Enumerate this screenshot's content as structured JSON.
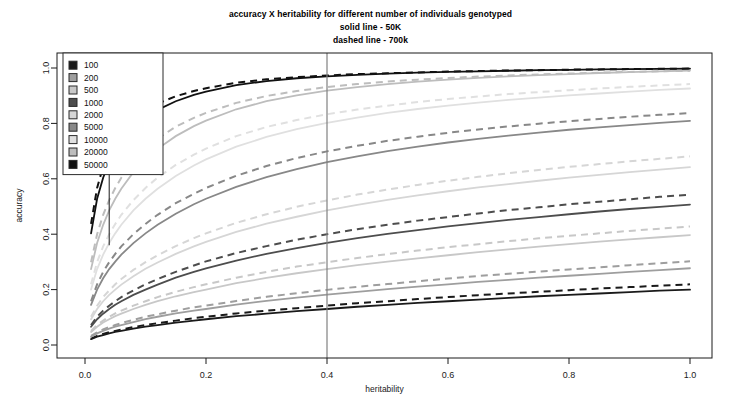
{
  "chart_data": {
    "type": "line",
    "title": "accuracy X heritability for different number of individuals genotyped",
    "subtitle_1": "solid line - 50K",
    "subtitle_2": "dashed line - 700k",
    "xlabel": "heritability",
    "ylabel": "accuracy",
    "xlim": [
      0.0,
      1.0
    ],
    "ylim": [
      0.0,
      1.0
    ],
    "xticks": [
      "0.0",
      "0.2",
      "0.4",
      "0.6",
      "0.8",
      "1.0"
    ],
    "xtick_values": [
      0.0,
      0.2,
      0.4,
      0.6,
      0.8,
      1.0
    ],
    "yticks": [
      "0.0",
      "0.2",
      "0.4",
      "0.6",
      "0.8",
      "1.0"
    ],
    "ytick_values": [
      0.0,
      0.2,
      0.4,
      0.6,
      0.8,
      1.0
    ],
    "grid": false,
    "legend_position": "top-left",
    "legend_title": "",
    "reference_lines": [
      {
        "name": "vertical-marker-0.4",
        "orientation": "vertical",
        "x": 0.4,
        "color": "#808080",
        "width": 1.2
      },
      {
        "name": "vertical-marker-0.04",
        "orientation": "vertical",
        "x": 0.04,
        "color": "#1a1a1a",
        "width": 1.0,
        "y_from": 0.36,
        "y_to": 1.05
      }
    ],
    "x": [
      0.01,
      0.02,
      0.03,
      0.04,
      0.05,
      0.06,
      0.08,
      0.1,
      0.12,
      0.15,
      0.18,
      0.2,
      0.25,
      0.3,
      0.35,
      0.4,
      0.45,
      0.5,
      0.55,
      0.6,
      0.65,
      0.7,
      0.75,
      0.8,
      0.85,
      0.9,
      0.95,
      1.0
    ],
    "series": [
      {
        "name": "100",
        "label": "100",
        "color": "#1a1a1a",
        "solid_values": [
          0.021,
          0.03,
          0.036,
          0.042,
          0.047,
          0.051,
          0.059,
          0.066,
          0.072,
          0.081,
          0.088,
          0.093,
          0.104,
          0.113,
          0.122,
          0.13,
          0.138,
          0.145,
          0.152,
          0.158,
          0.164,
          0.17,
          0.176,
          0.181,
          0.186,
          0.191,
          0.196,
          0.2
        ],
        "dashed_values": [
          0.023,
          0.033,
          0.04,
          0.046,
          0.051,
          0.056,
          0.065,
          0.072,
          0.079,
          0.088,
          0.097,
          0.102,
          0.114,
          0.124,
          0.133,
          0.142,
          0.151,
          0.158,
          0.166,
          0.173,
          0.18,
          0.186,
          0.192,
          0.198,
          0.204,
          0.209,
          0.214,
          0.219
        ]
      },
      {
        "name": "200",
        "label": "200",
        "color": "#9e9e9e",
        "solid_values": [
          0.03,
          0.042,
          0.051,
          0.059,
          0.066,
          0.072,
          0.083,
          0.093,
          0.102,
          0.114,
          0.124,
          0.13,
          0.146,
          0.159,
          0.171,
          0.182,
          0.192,
          0.202,
          0.211,
          0.219,
          0.228,
          0.235,
          0.243,
          0.25,
          0.257,
          0.264,
          0.27,
          0.277
        ],
        "dashed_values": [
          0.033,
          0.046,
          0.056,
          0.065,
          0.072,
          0.079,
          0.091,
          0.102,
          0.111,
          0.124,
          0.136,
          0.142,
          0.159,
          0.174,
          0.187,
          0.199,
          0.21,
          0.22,
          0.23,
          0.24,
          0.249,
          0.257,
          0.265,
          0.273,
          0.28,
          0.288,
          0.295,
          0.302
        ]
      },
      {
        "name": "500",
        "label": "500",
        "color": "#c8c8c8",
        "solid_values": [
          0.047,
          0.066,
          0.081,
          0.093,
          0.104,
          0.113,
          0.13,
          0.145,
          0.158,
          0.176,
          0.191,
          0.2,
          0.223,
          0.242,
          0.259,
          0.274,
          0.288,
          0.301,
          0.313,
          0.324,
          0.335,
          0.345,
          0.355,
          0.364,
          0.373,
          0.381,
          0.389,
          0.397
        ],
        "dashed_values": [
          0.051,
          0.072,
          0.088,
          0.102,
          0.114,
          0.124,
          0.142,
          0.158,
          0.173,
          0.192,
          0.209,
          0.219,
          0.243,
          0.264,
          0.283,
          0.299,
          0.314,
          0.328,
          0.341,
          0.353,
          0.364,
          0.375,
          0.385,
          0.394,
          0.403,
          0.412,
          0.42,
          0.428
        ]
      },
      {
        "name": "1000",
        "label": "1000",
        "color": "#4d4d4d",
        "solid_values": [
          0.066,
          0.093,
          0.113,
          0.13,
          0.145,
          0.158,
          0.181,
          0.2,
          0.218,
          0.243,
          0.264,
          0.277,
          0.305,
          0.329,
          0.35,
          0.369,
          0.386,
          0.401,
          0.415,
          0.428,
          0.44,
          0.452,
          0.462,
          0.472,
          0.482,
          0.491,
          0.499,
          0.507
        ],
        "dashed_values": [
          0.072,
          0.102,
          0.124,
          0.142,
          0.158,
          0.173,
          0.197,
          0.219,
          0.238,
          0.264,
          0.287,
          0.302,
          0.332,
          0.357,
          0.38,
          0.4,
          0.418,
          0.434,
          0.449,
          0.462,
          0.475,
          0.487,
          0.497,
          0.508,
          0.517,
          0.526,
          0.535,
          0.543
        ]
      },
      {
        "name": "2000",
        "label": "2000",
        "color": "#d6d6d6",
        "solid_values": [
          0.093,
          0.13,
          0.158,
          0.181,
          0.2,
          0.218,
          0.248,
          0.275,
          0.298,
          0.329,
          0.356,
          0.372,
          0.408,
          0.438,
          0.463,
          0.486,
          0.506,
          0.524,
          0.54,
          0.555,
          0.569,
          0.581,
          0.593,
          0.604,
          0.614,
          0.624,
          0.633,
          0.642
        ],
        "dashed_values": [
          0.102,
          0.142,
          0.173,
          0.197,
          0.219,
          0.238,
          0.271,
          0.299,
          0.324,
          0.357,
          0.386,
          0.403,
          0.441,
          0.472,
          0.499,
          0.522,
          0.543,
          0.561,
          0.578,
          0.593,
          0.607,
          0.62,
          0.632,
          0.643,
          0.653,
          0.663,
          0.672,
          0.681
        ]
      },
      {
        "name": "5000",
        "label": "5000",
        "color": "#888888",
        "solid_values": [
          0.145,
          0.2,
          0.241,
          0.274,
          0.301,
          0.326,
          0.368,
          0.403,
          0.434,
          0.474,
          0.508,
          0.528,
          0.571,
          0.606,
          0.635,
          0.66,
          0.681,
          0.7,
          0.716,
          0.731,
          0.744,
          0.756,
          0.767,
          0.777,
          0.786,
          0.794,
          0.802,
          0.809
        ],
        "dashed_values": [
          0.158,
          0.219,
          0.264,
          0.299,
          0.329,
          0.356,
          0.4,
          0.437,
          0.47,
          0.512,
          0.546,
          0.567,
          0.611,
          0.646,
          0.675,
          0.699,
          0.719,
          0.737,
          0.752,
          0.766,
          0.778,
          0.789,
          0.799,
          0.808,
          0.816,
          0.824,
          0.831,
          0.837
        ]
      },
      {
        "name": "10000",
        "label": "10000",
        "color": "#e0e0e0",
        "solid_values": [
          0.2,
          0.274,
          0.326,
          0.368,
          0.403,
          0.434,
          0.486,
          0.528,
          0.564,
          0.61,
          0.648,
          0.67,
          0.716,
          0.751,
          0.779,
          0.802,
          0.821,
          0.838,
          0.852,
          0.864,
          0.875,
          0.885,
          0.893,
          0.901,
          0.908,
          0.915,
          0.921,
          0.926
        ],
        "dashed_values": [
          0.219,
          0.299,
          0.356,
          0.4,
          0.437,
          0.47,
          0.523,
          0.567,
          0.604,
          0.65,
          0.687,
          0.709,
          0.754,
          0.787,
          0.812,
          0.833,
          0.85,
          0.864,
          0.877,
          0.888,
          0.897,
          0.906,
          0.913,
          0.92,
          0.926,
          0.932,
          0.937,
          0.942
        ]
      },
      {
        "name": "20000",
        "label": "20000",
        "color": "#bdbdbd",
        "solid_values": [
          0.274,
          0.368,
          0.434,
          0.486,
          0.528,
          0.564,
          0.624,
          0.67,
          0.708,
          0.754,
          0.79,
          0.81,
          0.851,
          0.88,
          0.901,
          0.918,
          0.931,
          0.942,
          0.951,
          0.958,
          0.964,
          0.97,
          0.974,
          0.978,
          0.982,
          0.985,
          0.988,
          0.991
        ],
        "dashed_values": [
          0.299,
          0.4,
          0.47,
          0.523,
          0.567,
          0.604,
          0.663,
          0.709,
          0.745,
          0.788,
          0.82,
          0.838,
          0.874,
          0.899,
          0.917,
          0.931,
          0.942,
          0.951,
          0.958,
          0.964,
          0.969,
          0.973,
          0.977,
          0.98,
          0.983,
          0.986,
          0.988,
          0.99
        ]
      },
      {
        "name": "50000",
        "label": "50000",
        "color": "#111111",
        "solid_values": [
          0.403,
          0.528,
          0.604,
          0.659,
          0.7,
          0.734,
          0.785,
          0.821,
          0.849,
          0.88,
          0.903,
          0.915,
          0.938,
          0.953,
          0.963,
          0.97,
          0.975,
          0.98,
          0.983,
          0.986,
          0.988,
          0.99,
          0.992,
          0.993,
          0.995,
          0.996,
          0.997,
          0.998
        ],
        "dashed_values": [
          0.437,
          0.567,
          0.645,
          0.698,
          0.738,
          0.769,
          0.815,
          0.847,
          0.871,
          0.898,
          0.917,
          0.927,
          0.947,
          0.959,
          0.967,
          0.973,
          0.978,
          0.981,
          0.984,
          0.987,
          0.989,
          0.991,
          0.992,
          0.994,
          0.995,
          0.996,
          0.997,
          0.998
        ]
      }
    ]
  },
  "legend": {
    "items": [
      {
        "label": "100",
        "swatch": "#1a1a1a"
      },
      {
        "label": "200",
        "swatch": "#9e9e9e"
      },
      {
        "label": "500",
        "swatch": "#c8c8c8"
      },
      {
        "label": "1000",
        "swatch": "#4d4d4d"
      },
      {
        "label": "2000",
        "swatch": "#d6d6d6"
      },
      {
        "label": "5000",
        "swatch": "#888888"
      },
      {
        "label": "10000",
        "swatch": "#e0e0e0"
      },
      {
        "label": "20000",
        "swatch": "#bdbdbd"
      },
      {
        "label": "50000",
        "swatch": "#111111"
      }
    ]
  },
  "colors": {
    "background": "#ffffff",
    "axis": "#1a1a1a",
    "frame": "#1a1a1a",
    "marker_line": "#808080"
  }
}
